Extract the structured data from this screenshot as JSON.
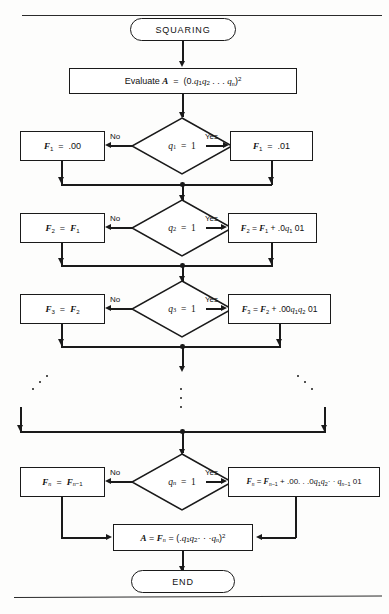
{
  "diagram": {
    "type": "flowchart",
    "title": "SQUARING",
    "start_label": "SQUARING",
    "end_label": "END",
    "evaluate_box": "Evaluate A = (0.q₁q₂ . . . qₙ)²",
    "final_box": "A = Fₙ = (.q₁q₂ · · ·qₙ)²",
    "branch_labels": {
      "no": "No",
      "yes": "Yes"
    },
    "rows": [
      {
        "id": "row-1",
        "decision": "q₁ = 1",
        "no_box": "F₁ = .00",
        "yes_box": "F₁ = .01"
      },
      {
        "id": "row-2",
        "decision": "q₂ = 1",
        "no_box": "F₂ = F₁",
        "yes_box": "F₂ = F₁ + .0q₁ 01"
      },
      {
        "id": "row-3",
        "decision": "q₃ = 1",
        "no_box": "F₃ = F₂",
        "yes_box": "F₃ = F₂ + .00q₁q₂ 01"
      },
      {
        "id": "row-n",
        "decision": "qₙ = 1",
        "no_box": "Fₙ = Fₙ₋₁",
        "yes_box": "Fₙ = Fₙ₋₁ + .00. . .0q₁q₂· · qₙ₋₁ 01"
      }
    ],
    "ellipsis": {
      "left": "⋰",
      "center": "⋮",
      "right": "⋱"
    },
    "colors": {
      "stroke": "#1a1a1a",
      "background": "#fdfdfc",
      "text": "#111111"
    }
  }
}
